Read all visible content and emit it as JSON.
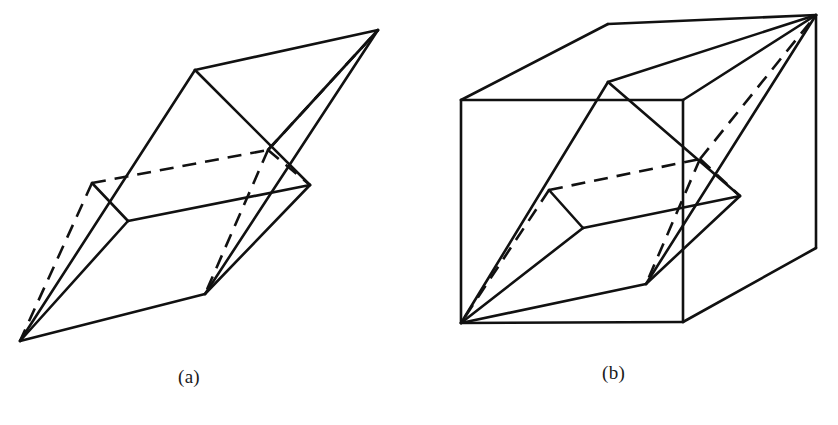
{
  "figure": {
    "background_color": "#ffffff",
    "ink_color": "#111111",
    "width": 838,
    "height": 425,
    "panels": [
      {
        "id": "panel-a",
        "caption": "(a)",
        "caption_position": {
          "x": 178,
          "y": 366
        },
        "description": "parallelepiped",
        "solid_stroke_width": 2.6,
        "dashed_stroke_width": 2.6,
        "dash_pattern": "14 9"
      },
      {
        "id": "panel-b",
        "caption": "(b)",
        "caption_position": {
          "x": 602,
          "y": 362
        },
        "description": "parallelepiped inscribed in rectangular box",
        "solid_stroke_width": 2.6,
        "dashed_stroke_width": 2.6,
        "dash_pattern": "14 9"
      }
    ]
  },
  "chart_data": {
    "type": "line",
    "title": "",
    "xlabel": "",
    "ylabel": "",
    "panel_a": {
      "label": "(a)",
      "vertices": {
        "front_bottom_left": [
          20,
          341
        ],
        "front_top_left": [
          195,
          70
        ],
        "front_bottom_right": [
          205,
          294
        ],
        "front_top_right": [
          378,
          30
        ],
        "mid_left_lower": [
          128,
          221
        ],
        "mid_left_upper": [
          92,
          183
        ],
        "mid_right_lower": [
          310,
          185
        ],
        "mid_right_upper": [
          268,
          150
        ]
      },
      "solid_edges": [
        [
          [
            20,
            341
          ],
          [
            195,
            70
          ]
        ],
        [
          [
            20,
            341
          ],
          [
            205,
            294
          ]
        ],
        [
          [
            20,
            341
          ],
          [
            128,
            221
          ]
        ],
        [
          [
            195,
            70
          ],
          [
            378,
            30
          ]
        ],
        [
          [
            195,
            70
          ],
          [
            310,
            185
          ]
        ],
        [
          [
            378,
            30
          ],
          [
            205,
            294
          ]
        ],
        [
          [
            378,
            30
          ],
          [
            268,
            150
          ]
        ],
        [
          [
            205,
            294
          ],
          [
            310,
            185
          ]
        ],
        [
          [
            92,
            183
          ],
          [
            128,
            221
          ]
        ],
        [
          [
            128,
            221
          ],
          [
            310,
            185
          ]
        ]
      ],
      "dashed_edges": [
        [
          [
            92,
            183
          ],
          [
            268,
            150
          ]
        ],
        [
          [
            268,
            150
          ],
          [
            310,
            185
          ]
        ],
        [
          [
            92,
            183
          ],
          [
            20,
            341
          ]
        ],
        [
          [
            268,
            150
          ],
          [
            205,
            294
          ]
        ],
        [
          [
            268,
            150
          ],
          [
            378,
            30
          ]
        ]
      ]
    },
    "panel_b": {
      "label": "(b)",
      "box_vertices": {
        "front_bottom_left": [
          461,
          323
        ],
        "front_top_left": [
          461,
          100
        ],
        "front_bottom_right": [
          683,
          322
        ],
        "front_top_right": [
          683,
          100
        ],
        "back_top_left": [
          608,
          24
        ],
        "back_top_right": [
          816,
          15
        ],
        "back_bottom_right": [
          816,
          248
        ]
      },
      "box_solid_edges": [
        [
          [
            461,
            323
          ],
          [
            461,
            100
          ]
        ],
        [
          [
            461,
            100
          ],
          [
            683,
            100
          ]
        ],
        [
          [
            683,
            100
          ],
          [
            683,
            322
          ]
        ],
        [
          [
            683,
            322
          ],
          [
            461,
            323
          ]
        ],
        [
          [
            461,
            100
          ],
          [
            608,
            24
          ]
        ],
        [
          [
            608,
            24
          ],
          [
            816,
            15
          ]
        ],
        [
          [
            816,
            15
          ],
          [
            683,
            100
          ]
        ],
        [
          [
            816,
            15
          ],
          [
            816,
            248
          ]
        ],
        [
          [
            816,
            248
          ],
          [
            683,
            322
          ]
        ]
      ],
      "inner_vertices": {
        "bottom_left": [
          461,
          323
        ],
        "top_right": [
          816,
          15
        ],
        "front_top_left": [
          608,
          82
        ],
        "front_bottom_right": [
          646,
          284
        ],
        "mid_left_lower": [
          583,
          228
        ],
        "mid_left_upper": [
          549,
          190
        ],
        "mid_right_lower": [
          740,
          196
        ],
        "mid_right_upper": [
          700,
          159
        ]
      },
      "inner_solid_edges": [
        [
          [
            461,
            323
          ],
          [
            608,
            82
          ]
        ],
        [
          [
            461,
            323
          ],
          [
            646,
            284
          ]
        ],
        [
          [
            461,
            323
          ],
          [
            583,
            228
          ]
        ],
        [
          [
            608,
            82
          ],
          [
            816,
            15
          ]
        ],
        [
          [
            608,
            82
          ],
          [
            740,
            196
          ]
        ],
        [
          [
            816,
            15
          ],
          [
            646,
            284
          ]
        ],
        [
          [
            646,
            284
          ],
          [
            740,
            196
          ]
        ],
        [
          [
            549,
            190
          ],
          [
            583,
            228
          ]
        ],
        [
          [
            583,
            228
          ],
          [
            740,
            196
          ]
        ]
      ],
      "inner_dashed_edges": [
        [
          [
            549,
            190
          ],
          [
            700,
            159
          ]
        ],
        [
          [
            700,
            159
          ],
          [
            740,
            196
          ]
        ],
        [
          [
            549,
            190
          ],
          [
            461,
            323
          ]
        ],
        [
          [
            700,
            159
          ],
          [
            646,
            284
          ]
        ],
        [
          [
            700,
            159
          ],
          [
            816,
            15
          ]
        ]
      ]
    }
  }
}
